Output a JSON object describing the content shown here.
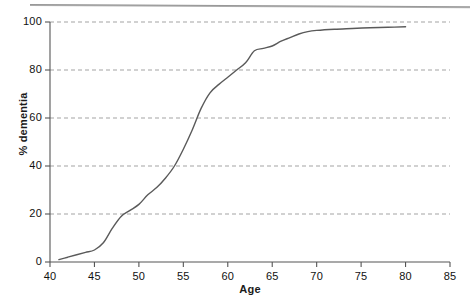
{
  "figure": {
    "top_rule": "horizontal-rule",
    "background_color": "#ffffff",
    "line_color": "#5a5a5a",
    "grid_color": "#999999",
    "axis_color": "#555555"
  },
  "chart_data": {
    "type": "line",
    "title": "",
    "xlabel": "Age",
    "ylabel": "% dementia",
    "xlim": [
      40,
      85
    ],
    "ylim": [
      0,
      100
    ],
    "xticks": [
      40,
      45,
      50,
      55,
      60,
      65,
      70,
      75,
      80,
      85
    ],
    "yticks": [
      0,
      20,
      40,
      60,
      80,
      100
    ],
    "xtick_labels": [
      "40",
      "45",
      "50",
      "55",
      "60",
      "65",
      "70",
      "75",
      "80",
      "85"
    ],
    "ytick_labels": [
      "0",
      "20",
      "40",
      "60",
      "80",
      "100"
    ],
    "grid": "horizontal-dashed",
    "legend": "none",
    "series": [
      {
        "name": "% dementia",
        "x": [
          41,
          42,
          43,
          44,
          45,
          46,
          47,
          48,
          49,
          50,
          51,
          52,
          53,
          54,
          55,
          56,
          57,
          58,
          59,
          60,
          61,
          62,
          63,
          64,
          65,
          66,
          67,
          68,
          69,
          70,
          72,
          74,
          76,
          78,
          80
        ],
        "values": [
          1,
          2,
          3,
          4,
          5,
          8,
          14,
          19,
          21.5,
          24,
          28,
          31,
          35,
          40,
          47,
          55,
          64,
          70.5,
          74,
          77,
          80,
          83,
          88,
          89,
          90,
          92,
          93.5,
          95,
          96,
          96.5,
          97,
          97.3,
          97.6,
          97.8,
          98
        ]
      }
    ]
  }
}
